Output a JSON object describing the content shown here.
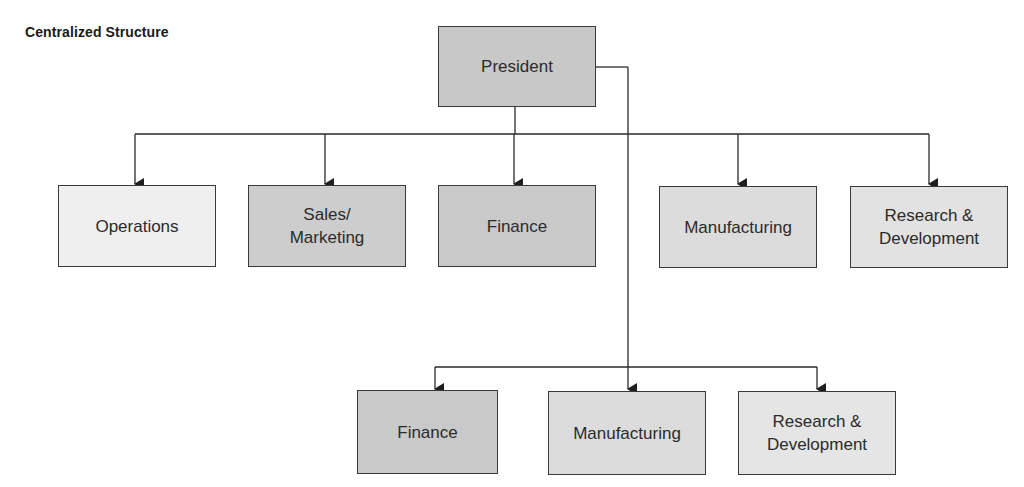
{
  "title": "Centralized Structure",
  "colors": {
    "line": "#2a2a2a",
    "border": "#3a3a3a",
    "fill_dark": "#c8c8c8",
    "fill_mid": "#d9d9d9",
    "fill_light": "#e3e3e3",
    "fill_lightest": "#efefef"
  },
  "root": {
    "label": "President"
  },
  "top_row": [
    {
      "label": "Operations"
    },
    {
      "label": "Sales/\nMarketing"
    },
    {
      "label": "Finance"
    },
    {
      "label": "Manufacturing"
    },
    {
      "label": "Research &\nDevelopment"
    }
  ],
  "bottom_row": [
    {
      "label": "Finance"
    },
    {
      "label": "Manufacturing"
    },
    {
      "label": "Research &\nDevelopment"
    }
  ]
}
